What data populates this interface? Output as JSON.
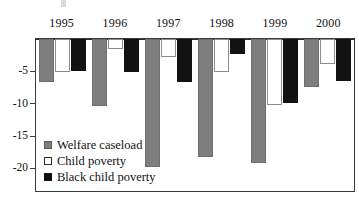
{
  "chart_data": {
    "type": "bar",
    "title": "",
    "subtitle": "",
    "xlabel": "",
    "ylabel": "",
    "categories": [
      "1995",
      "1996",
      "1997",
      "1998",
      "1999",
      "2000"
    ],
    "series": [
      {
        "name": "Welfare caseload",
        "color": "#7e7e7e",
        "values": [
          -6.7,
          -10.4,
          -19.8,
          -18.3,
          -19.1,
          -7.4
        ]
      },
      {
        "name": "Child poverty",
        "color": "#ffffff",
        "values": [
          -5.1,
          -1.5,
          -2.8,
          -5.1,
          -10.2,
          -3.9
        ]
      },
      {
        "name": "Black child poverty",
        "color": "#111111",
        "values": [
          -5.0,
          -5.1,
          -6.7,
          -2.3,
          -9.9,
          -6.5
        ]
      }
    ],
    "ylim": [
      -23.5,
      0
    ],
    "yticks": [
      -5,
      -10,
      -15,
      -20
    ],
    "ytick_labels": [
      "-5",
      "-10",
      "-15",
      "-20"
    ],
    "grid": false,
    "legend_position": "inside-lower-left",
    "axis_note": "years labeled above the plot; all bars extend downward from the zero baseline"
  },
  "axis": {
    "ticks": [
      {
        "label": "-5",
        "value": -5
      },
      {
        "label": "-10",
        "value": -10
      },
      {
        "label": "-15",
        "value": -15
      },
      {
        "label": "-20",
        "value": -20
      }
    ]
  },
  "legend": {
    "items": [
      {
        "label": "Welfare caseload",
        "swatch": "welfare"
      },
      {
        "label": "Child poverty",
        "swatch": "child"
      },
      {
        "label": "Black child poverty",
        "swatch": "black"
      }
    ]
  }
}
